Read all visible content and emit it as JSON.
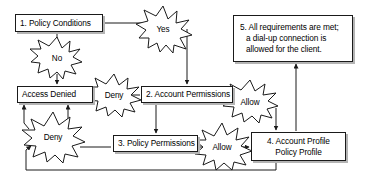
{
  "diagram": {
    "colors": {
      "outline": "#1a1a1a",
      "shadow": "#b4b4b4",
      "fill": "#ffffff",
      "background": "#ffffff"
    },
    "nodes": [
      {
        "id": "policy-conditions",
        "name": "node-policy-conditions",
        "lines": [
          "1. Policy Conditions"
        ],
        "x": 15,
        "y": 14,
        "w": 88,
        "h": 18,
        "align": "left"
      },
      {
        "id": "access-denied",
        "name": "node-access-denied",
        "lines": [
          "Access Denied"
        ],
        "x": 17,
        "y": 86,
        "w": 76,
        "h": 17,
        "align": "left"
      },
      {
        "id": "account-permissions",
        "name": "node-account-permissions",
        "lines": [
          "2. Account Permissions"
        ],
        "x": 141,
        "y": 86,
        "w": 92,
        "h": 17,
        "align": "left"
      },
      {
        "id": "policy-permissions",
        "name": "node-policy-permissions",
        "lines": [
          "3. Policy Permissions"
        ],
        "x": 113,
        "y": 135,
        "w": 85,
        "h": 17,
        "align": "left"
      },
      {
        "id": "account-profile",
        "name": "node-account-profile",
        "lines": [
          "4. Account Profile",
          "Policy Profile"
        ],
        "x": 251,
        "y": 132,
        "w": 95,
        "h": 29,
        "align": "center"
      },
      {
        "id": "requirements-met",
        "name": "node-requirements-met",
        "lines": [
          "5. All requirements are met;",
          "a dial-up connection is",
          "allowed for the client."
        ],
        "x": 233,
        "y": 15,
        "w": 120,
        "h": 47,
        "align": "left"
      }
    ],
    "bursts": [
      {
        "id": "burst-yes",
        "name": "burst-yes",
        "label": "Yes",
        "cx": 163,
        "cy": 29,
        "rx": 24,
        "ry": 23
      },
      {
        "id": "burst-no",
        "name": "burst-no",
        "label": "No",
        "cx": 57,
        "cy": 58,
        "rx": 24,
        "ry": 21
      },
      {
        "id": "burst-deny-1",
        "name": "burst-deny-upper",
        "label": "Deny",
        "cx": 114,
        "cy": 95,
        "rx": 25,
        "ry": 21
      },
      {
        "id": "burst-deny-2",
        "name": "burst-deny-lower",
        "label": "Deny",
        "cx": 53,
        "cy": 137,
        "rx": 30,
        "ry": 25
      },
      {
        "id": "burst-allow-1",
        "name": "burst-allow-upper",
        "label": "Allow",
        "cx": 250,
        "cy": 102,
        "rx": 28,
        "ry": 22
      },
      {
        "id": "burst-allow-2",
        "name": "burst-allow-lower",
        "label": "Allow",
        "cx": 222,
        "cy": 147,
        "rx": 28,
        "ry": 24
      }
    ],
    "connectors": [
      {
        "id": "c-policy-to-yes",
        "name": "connector-policy-to-yes"
      },
      {
        "id": "c-policy-to-no",
        "name": "connector-policy-to-no"
      },
      {
        "id": "c-no-to-access-denied",
        "name": "connector-no-to-access-denied"
      },
      {
        "id": "c-yes-to-account-perm",
        "name": "connector-yes-to-account-permissions"
      },
      {
        "id": "c-acct-to-deny",
        "name": "connector-account-permissions-to-deny"
      },
      {
        "id": "c-deny-to-access-denied",
        "name": "connector-deny-to-access-denied"
      },
      {
        "id": "c-acct-to-policy-perm",
        "name": "connector-account-permissions-to-policy-permissions"
      },
      {
        "id": "c-acct-to-allow",
        "name": "connector-account-permissions-to-allow"
      },
      {
        "id": "c-allow-to-profile-top",
        "name": "connector-allow-to-account-profile-top"
      },
      {
        "id": "c-policyperm-to-allow",
        "name": "connector-policy-permissions-to-allow"
      },
      {
        "id": "c-allow-to-profile-left",
        "name": "connector-allow-to-account-profile-left"
      },
      {
        "id": "c-policyperm-to-deny",
        "name": "connector-policy-permissions-to-deny"
      },
      {
        "id": "c-deny2-to-access-denied",
        "name": "connector-deny-lower-to-access-denied"
      },
      {
        "id": "c-profile-loopback",
        "name": "connector-account-profile-loopback-to-deny"
      },
      {
        "id": "c-profile-to-requirements",
        "name": "connector-account-profile-to-requirements-met"
      }
    ]
  }
}
